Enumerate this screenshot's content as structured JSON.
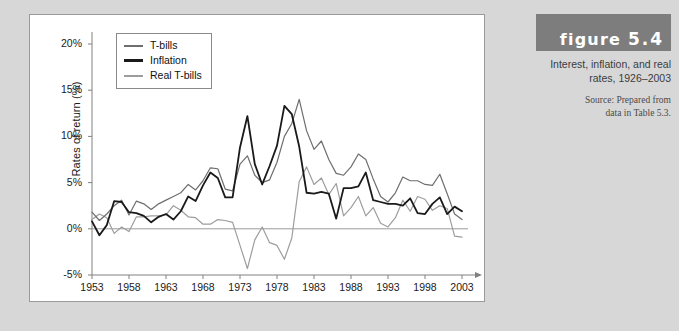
{
  "figure": {
    "banner_word": "figure",
    "banner_number": "5.4",
    "title": "Interest, inflation, and real rates, 1926–2003",
    "source_line1": "Source: Prepared from",
    "source_line2": "data in Table 5.3."
  },
  "legend": {
    "items": [
      {
        "label": "T-bills",
        "color": "#6e6e6e"
      },
      {
        "label": "Inflation",
        "color": "#1a1a1a"
      },
      {
        "label": "Real T-bills",
        "color": "#9d9d9d"
      }
    ]
  },
  "chart_data": {
    "type": "line",
    "title": "Interest, inflation, and real rates, 1926–2003",
    "xlabel": "",
    "ylabel": "Rates of return (%)",
    "xlim": [
      1953,
      2003
    ],
    "ylim": [
      -5,
      20
    ],
    "ytick_labels": [
      "20%",
      "15%",
      "10%",
      "5%",
      "0%",
      "-5%"
    ],
    "ytick_values": [
      20,
      15,
      10,
      5,
      0,
      -5
    ],
    "xtick_labels": [
      "1953",
      "1958",
      "1963",
      "1968",
      "1973",
      "1978",
      "1983",
      "1988",
      "1993",
      "1998",
      "2003"
    ],
    "xtick_values": [
      1953,
      1958,
      1963,
      1968,
      1973,
      1978,
      1983,
      1988,
      1993,
      1998,
      2003
    ],
    "grid": false,
    "legend_position": "top-left",
    "zero_line": 0,
    "x": [
      1953,
      1954,
      1955,
      1956,
      1957,
      1958,
      1959,
      1960,
      1961,
      1962,
      1963,
      1964,
      1965,
      1966,
      1967,
      1968,
      1969,
      1970,
      1971,
      1972,
      1973,
      1974,
      1975,
      1976,
      1977,
      1978,
      1979,
      1980,
      1981,
      1982,
      1983,
      1984,
      1985,
      1986,
      1987,
      1988,
      1989,
      1990,
      1991,
      1992,
      1993,
      1994,
      1995,
      1996,
      1997,
      1998,
      1999,
      2000,
      2001,
      2002,
      2003
    ],
    "series": [
      {
        "name": "T-bills",
        "color": "#6e6e6e",
        "values": [
          1.8,
          0.9,
          1.6,
          2.5,
          3.1,
          1.5,
          3.0,
          2.7,
          2.1,
          2.7,
          3.1,
          3.5,
          3.9,
          4.8,
          4.2,
          5.2,
          6.6,
          6.5,
          4.3,
          4.1,
          7.0,
          7.9,
          5.8,
          5.0,
          5.3,
          7.2,
          10.0,
          11.4,
          14.0,
          10.6,
          8.6,
          9.5,
          7.5,
          6.0,
          5.8,
          6.7,
          8.1,
          7.5,
          5.4,
          3.5,
          2.9,
          3.9,
          5.6,
          5.2,
          5.2,
          4.8,
          4.7,
          5.9,
          3.8,
          1.6,
          1.0
        ]
      },
      {
        "name": "Inflation",
        "color": "#1a1a1a",
        "values": [
          0.8,
          -0.7,
          0.4,
          3.0,
          2.9,
          1.8,
          1.7,
          1.4,
          0.7,
          1.3,
          1.6,
          1.0,
          1.9,
          3.5,
          3.0,
          4.7,
          6.1,
          5.5,
          3.4,
          3.4,
          8.8,
          12.2,
          7.0,
          4.8,
          6.8,
          9.0,
          13.3,
          12.4,
          8.9,
          3.9,
          3.8,
          4.0,
          3.8,
          1.1,
          4.4,
          4.4,
          4.6,
          6.1,
          3.1,
          2.9,
          2.7,
          2.7,
          2.5,
          3.3,
          1.7,
          1.6,
          2.7,
          3.4,
          1.6,
          2.4,
          1.9
        ]
      },
      {
        "name": "Real T-bills",
        "color": "#9d9d9d",
        "values": [
          1.0,
          1.6,
          1.2,
          -0.5,
          0.2,
          -0.3,
          1.3,
          1.3,
          1.4,
          1.4,
          1.5,
          2.5,
          2.0,
          1.3,
          1.2,
          0.5,
          0.5,
          1.0,
          0.9,
          0.7,
          -1.8,
          -4.3,
          -1.2,
          0.2,
          -1.5,
          -1.8,
          -3.3,
          -1.0,
          5.1,
          6.7,
          4.8,
          5.5,
          3.7,
          4.9,
          1.4,
          2.3,
          3.5,
          1.4,
          2.3,
          0.6,
          0.2,
          1.2,
          3.1,
          1.9,
          3.5,
          3.2,
          2.0,
          2.5,
          2.2,
          -0.8,
          -0.9
        ]
      }
    ]
  }
}
